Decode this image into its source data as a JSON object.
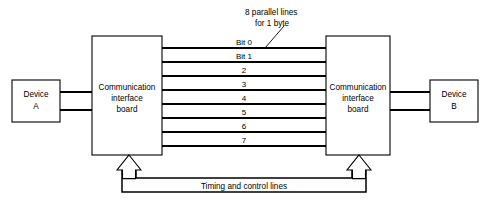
{
  "diagram": {
    "title_note": {
      "line1": "8 parallel lines",
      "line2": "for 1 byte"
    },
    "left_device": {
      "line1": "Device",
      "line2": "A"
    },
    "right_device": {
      "line1": "Device",
      "line2": "B"
    },
    "left_board": {
      "line1": "Communication",
      "line2": "interface",
      "line3": "board"
    },
    "right_board": {
      "line1": "Communication",
      "line2": "interface",
      "line3": "board"
    },
    "bus_lines": [
      {
        "label": "Bit 0"
      },
      {
        "label": "Bit 1"
      },
      {
        "label": "2"
      },
      {
        "label": "3"
      },
      {
        "label": "4"
      },
      {
        "label": "5"
      },
      {
        "label": "6"
      },
      {
        "label": "7"
      }
    ],
    "control_label": "Timing and control lines",
    "colors": {
      "stroke": "#000000",
      "fill": "#ffffff",
      "background": "#ffffff"
    }
  }
}
